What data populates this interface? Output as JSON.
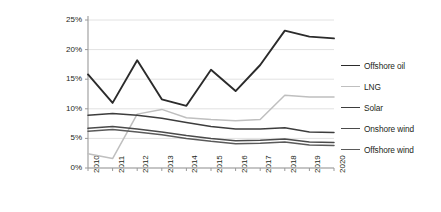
{
  "chart_data": {
    "type": "line",
    "title": "",
    "xlabel": "",
    "ylabel": "Internal Rate of Return (%)",
    "grid": true,
    "legend_position": "right",
    "x": [
      2010,
      2011,
      2012,
      2013,
      2014,
      2015,
      2016,
      2017,
      2018,
      2019,
      2020
    ],
    "categories": [
      "2010",
      "2011",
      "2012",
      "2013",
      "2014",
      "2015",
      "2016",
      "2017",
      "2018",
      "2019",
      "2020"
    ],
    "ylim": [
      0,
      25
    ],
    "yticks": [
      0,
      5,
      10,
      15,
      20,
      25
    ],
    "ytick_labels": [
      "0%",
      "5%",
      "10%",
      "15%",
      "20%",
      "25%"
    ],
    "series": [
      {
        "name": "Offshore oil",
        "color": "#2b2b2b",
        "width": 1.9,
        "values": [
          15.8,
          11.0,
          18.2,
          11.6,
          10.5,
          16.6,
          13.0,
          17.4,
          23.2,
          22.2,
          21.9
        ]
      },
      {
        "name": "LNG",
        "color": "#bfbfbf",
        "width": 1.5,
        "values": [
          2.4,
          1.6,
          9.1,
          9.9,
          8.5,
          8.2,
          8.0,
          8.2,
          12.3,
          12.0,
          12.0
        ]
      },
      {
        "name": "Solar",
        "color": "#3d3d3d",
        "width": 1.5,
        "values": [
          8.9,
          9.2,
          8.9,
          8.4,
          7.7,
          7.0,
          6.6,
          6.6,
          6.8,
          6.1,
          6.0
        ]
      },
      {
        "name": "Onshore wind",
        "color": "#4a4a4a",
        "width": 1.5,
        "values": [
          6.7,
          7.0,
          6.6,
          6.1,
          5.5,
          5.0,
          4.6,
          4.7,
          4.9,
          4.4,
          4.3
        ]
      },
      {
        "name": "Offshore wind",
        "color": "#5a5a5a",
        "width": 1.5,
        "values": [
          6.2,
          6.5,
          6.1,
          5.6,
          5.0,
          4.5,
          4.1,
          4.2,
          4.4,
          3.9,
          3.8
        ]
      }
    ]
  },
  "axis": {
    "y_label": "Internal Rate of Return (%)",
    "y_ticks": [
      "25%",
      "20%",
      "15%",
      "10%",
      "5%",
      "0%"
    ],
    "x_ticks": [
      "2010",
      "2011",
      "2012",
      "2013",
      "2014",
      "2015",
      "2016",
      "2017",
      "2018",
      "2019",
      "2020"
    ]
  },
  "legend": {
    "items": [
      {
        "label": "Offshore oil",
        "color": "#2b2b2b"
      },
      {
        "label": "LNG",
        "color": "#bfbfbf"
      },
      {
        "label": "Solar",
        "color": "#3d3d3d"
      },
      {
        "label": "Onshore wind",
        "color": "#4a4a4a"
      },
      {
        "label": "Offshore wind",
        "color": "#5a5a5a"
      }
    ]
  },
  "colors": {
    "axis": "#9a9a9a",
    "grid": "#e2e2e2",
    "text": "#231f20",
    "background": "#ffffff"
  }
}
